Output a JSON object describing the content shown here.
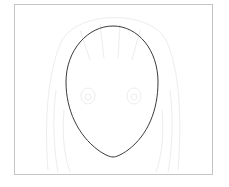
{
  "diagram": {
    "frame": {
      "border_color": "#c4c4c4",
      "background": "#ffffff"
    },
    "face_outline": {
      "shape": "egg",
      "stroke_color": "#3a3a3a",
      "top": [
        113,
        26
      ],
      "left": [
        66,
        85
      ],
      "right": [
        158,
        85
      ],
      "chin": [
        113,
        157
      ]
    },
    "reference_sketch": {
      "opacity_hint": "very faint",
      "color": "#ececec",
      "features": [
        "hair",
        "left-eye",
        "right-eye",
        "bangs"
      ]
    }
  }
}
